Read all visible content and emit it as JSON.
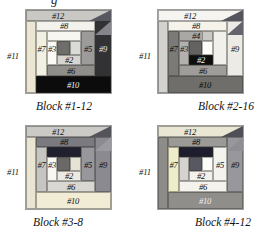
{
  "figure": {
    "top_text_fragment": "g"
  },
  "blocks": [
    {
      "caption": "Block #1-12",
      "pieces": {
        "p12": {
          "label": "#12",
          "bg": "#c9c8c4",
          "fg": "#121212"
        },
        "p11": {
          "label": "#11",
          "bg": "#ebe6d1",
          "fg": "#141414"
        },
        "p8": {
          "label": "#8",
          "bg": "#f3f2ec",
          "fg": "#121212"
        },
        "p9": {
          "label": "#9",
          "bg": "#323234",
          "fg": "#e9e9e5",
          "hatch": "light"
        },
        "p7": {
          "label": "#7",
          "bg": "#f2f0e3",
          "fg": "#121212"
        },
        "p4": {
          "label": "",
          "bg": "#f7f6f0",
          "fg": "#121212"
        },
        "p5": {
          "label": "#5",
          "bg": "#9c9b99",
          "fg": "#0e0e0e"
        },
        "p3": {
          "label": "#3",
          "bg": "#fbfaf4",
          "fg": "#121212"
        },
        "center": {
          "label": "",
          "bg": "#6e6d6b",
          "fg": "#ffffff"
        },
        "c1": {
          "label": "",
          "bg": "#dadad6",
          "fg": "#121212"
        },
        "p2": {
          "label": "#2",
          "bg": "#d6d5d1",
          "fg": "#0e0e0e"
        },
        "p6": {
          "label": "#6",
          "bg": "#8f8e8a",
          "fg": "#0c0c0c"
        },
        "p10": {
          "label": "#10",
          "bg": "#0c0c0c",
          "fg": "#f4f4f0"
        },
        "corner": {
          "label": "",
          "bg": "#57575f"
        },
        "corner2": {
          "label": "",
          "bg": "#85858b"
        }
      }
    },
    {
      "caption": "Block #2-16",
      "pieces": {
        "p12": {
          "label": "#12",
          "bg": "#f5f4f0",
          "fg": "#121212"
        },
        "p11": {
          "label": "#11",
          "bg": "#d3d2ce",
          "fg": "#141414"
        },
        "p8": {
          "label": "#8",
          "bg": "#f5f3ea",
          "fg": "#121212"
        },
        "p9": {
          "label": "#9",
          "bg": "#ecebe5",
          "fg": "#121212"
        },
        "p7": {
          "label": "#7",
          "bg": "#7b7a78",
          "fg": "#0c0c0c"
        },
        "p4": {
          "label": "#4",
          "bg": "#a9a8a4",
          "fg": "#0e0e0e"
        },
        "p4end": {
          "label": "",
          "bg": "#c9c8c4"
        },
        "p5": {
          "label": "",
          "bg": "#f1f0ea",
          "fg": "#121212"
        },
        "p3": {
          "label": "#3",
          "bg": "#b2b1ad",
          "fg": "#0e0e0e"
        },
        "center": {
          "label": "",
          "bg": "#636260",
          "fg": "#ffffff"
        },
        "c1": {
          "label": "",
          "bg": "#fdfdf9",
          "fg": "#121212"
        },
        "p2": {
          "label": "#2",
          "bg": "#0e0e0e",
          "fg": "#f5f5f1"
        },
        "p6": {
          "label": "#6",
          "bg": "#9e9d99",
          "fg": "#0c0c0c"
        },
        "p10": {
          "label": "#10",
          "bg": "#6f6e6a",
          "fg": "#050505"
        },
        "corner": {
          "label": "",
          "bg": "#55555d"
        },
        "corner2": {
          "label": "",
          "bg": "#63636b"
        }
      }
    },
    {
      "caption": "Block #3-8",
      "pieces": {
        "p12": {
          "label": "#12",
          "bg": "#cbcac6",
          "fg": "#121212"
        },
        "p11": {
          "label": "#11",
          "bg": "#e9e5d2",
          "fg": "#141414"
        },
        "p8": {
          "label": "#8",
          "bg": "#7b7a80",
          "fg": "#0a0a0a"
        },
        "p9": {
          "label": "#9",
          "bg": "#8b8a90",
          "fg": "#0e0e0e"
        },
        "p7": {
          "label": "#7",
          "bg": "#c6c5c1",
          "fg": "#0e0e0e"
        },
        "p4": {
          "label": "",
          "bg": "#20202f",
          "hatch": "dark"
        },
        "p5": {
          "label": "#5",
          "bg": "#98979b",
          "fg": "#0e0e0e"
        },
        "p3": {
          "label": "#3",
          "bg": "#f8f7f1",
          "fg": "#121212"
        },
        "center": {
          "label": "",
          "bg": "#6a6967",
          "fg": "#ffffff"
        },
        "c1": {
          "label": "",
          "bg": "#e6e2d6",
          "fg": "#121212"
        },
        "p2": {
          "label": "#2",
          "bg": "#eceae2",
          "fg": "#0e0e0e"
        },
        "p6": {
          "label": "#6",
          "bg": "#d8d7d1",
          "fg": "#0c0c0c"
        },
        "p10": {
          "label": "#10",
          "bg": "#f1ecd6",
          "fg": "#121212"
        },
        "corner": {
          "label": "",
          "bg": "#53535b"
        },
        "corner2": {
          "label": "",
          "bg": "#9a9aa0"
        }
      }
    },
    {
      "caption": "Block #4-12",
      "pieces": {
        "p12": {
          "label": "#12",
          "bg": "#eae6d4",
          "fg": "#121212"
        },
        "p11": {
          "label": "#11",
          "bg": "#8d8c88",
          "fg": "#141414"
        },
        "p8": {
          "label": "#8",
          "bg": "#9b9a96",
          "fg": "#0a0a0a"
        },
        "p9": {
          "label": "#9",
          "bg": "#98979b",
          "fg": "#0e0e0e"
        },
        "p7": {
          "label": "#7",
          "bg": "#efecc9",
          "fg": "#0e0e0e"
        },
        "p4": {
          "label": "",
          "bg": "#1d1d2e",
          "hatch": "dark"
        },
        "p5": {
          "label": "#5",
          "bg": "#f4f3ed",
          "fg": "#0e0e0e"
        },
        "p3": {
          "label": "",
          "bg": "#d4d3cf",
          "fg": "#121212"
        },
        "center": {
          "label": "",
          "bg": "#585862",
          "fg": "#ffffff"
        },
        "c1": {
          "label": "",
          "bg": "#fbfbf7",
          "fg": "#121212"
        },
        "p2": {
          "label": "#2",
          "bg": "#f2f1eb",
          "fg": "#0e0e0e"
        },
        "p6": {
          "label": "#6",
          "bg": "#f4f3ed",
          "fg": "#0c0c0c"
        },
        "p10": {
          "label": "#10",
          "bg": "#8f8e8a",
          "fg": "#f2f2ee"
        },
        "corner": {
          "label": "",
          "bg": "#4f4f57"
        },
        "corner2": {
          "label": "",
          "bg": "#8e8e94"
        }
      }
    }
  ]
}
